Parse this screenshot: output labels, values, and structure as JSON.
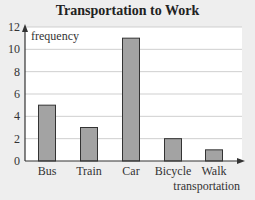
{
  "chart_data": {
    "type": "bar",
    "title": "Transportation to Work",
    "xlabel": "transportation",
    "ylabel": "frequency",
    "categories": [
      "Bus",
      "Train",
      "Car",
      "Bicycle",
      "Walk"
    ],
    "values": [
      5,
      3,
      11,
      2,
      1
    ],
    "yticks": [
      0,
      2,
      4,
      6,
      8,
      10,
      12
    ],
    "ylim": [
      0,
      12
    ],
    "grid": true,
    "legend": null,
    "colors": {
      "bar_fill": "#a3a3a3",
      "bar_stroke": "#333333",
      "plot_bg": "#ffffff",
      "grid": "#cfcfcf",
      "page_bg": "#eeeeee"
    }
  }
}
